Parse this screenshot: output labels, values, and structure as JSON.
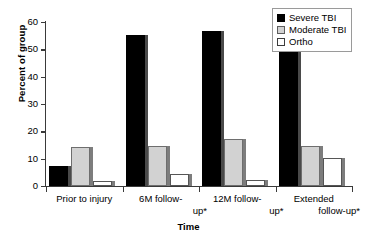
{
  "chart_data": {
    "type": "bar",
    "title": "",
    "xlabel": "Time",
    "ylabel": "Percent of group",
    "ylim": [
      0,
      60
    ],
    "yticks": [
      0,
      10,
      20,
      30,
      40,
      50,
      60
    ],
    "ytick_labels": [
      "0",
      "10",
      "20",
      "30",
      "40",
      "50",
      "60"
    ],
    "grid": false,
    "legend_position": "top-right",
    "categories": [
      "Prior to injury",
      "6M follow-up*",
      "12M follow-up*",
      "Extended follow-up*"
    ],
    "category_lines": [
      [
        "Prior to injury"
      ],
      [
        "6M follow-",
        "up*"
      ],
      [
        "12M follow-",
        "up*"
      ],
      [
        "Extended",
        "follow-up*"
      ]
    ],
    "series": [
      {
        "name": "Severe TBI",
        "color": "#000000",
        "values": [
          7.2,
          55.3,
          56.7,
          50.0
        ]
      },
      {
        "name": "Moderate TBI",
        "color": "#d2d2d2",
        "values": [
          14.2,
          14.7,
          17.3,
          14.7
        ]
      },
      {
        "name": "Ortho",
        "color": "#ffffff",
        "values": [
          1.9,
          4.5,
          2.3,
          10.4
        ]
      }
    ]
  },
  "legend": {
    "items": [
      {
        "label": "Severe TBI",
        "swatch": "filled-black-square"
      },
      {
        "label": "Moderate TBI",
        "swatch": "filled-gray-square"
      },
      {
        "label": "Ortho",
        "swatch": "empty-white-square"
      }
    ]
  },
  "colors": {
    "severe": "#000000",
    "moderate": "#d2d2d2",
    "ortho": "#ffffff",
    "axis": "#3a3a3a",
    "bar_shadow": "#7d7d7d",
    "background": "#ffffff"
  }
}
